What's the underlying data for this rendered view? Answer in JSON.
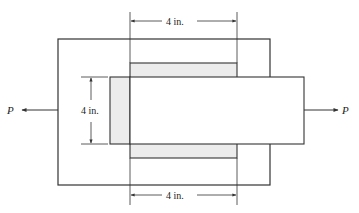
{
  "diagram": {
    "type": "lap joint / splice plate under axial load",
    "load_left_label": "P",
    "load_right_label": "P",
    "dim_top_label": "4 in.",
    "dim_left_label": "4 in.",
    "dim_bottom_label": "4 in.",
    "colors": {
      "line": "#333333",
      "shade": "#ececec",
      "background": "#ffffff"
    }
  }
}
